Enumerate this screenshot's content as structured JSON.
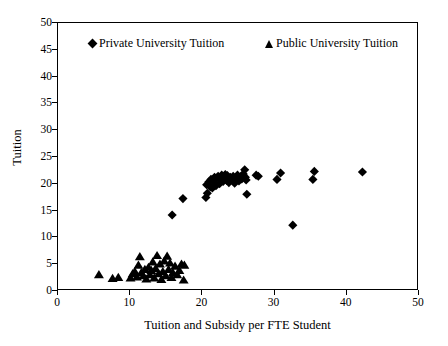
{
  "chart_data": {
    "type": "scatter",
    "title": "",
    "xlabel": "Tuition and Subsidy per FTE Student",
    "ylabel": "Tuition",
    "xlim": [
      0,
      50
    ],
    "ylim": [
      0,
      50
    ],
    "xticks": [
      0,
      10,
      20,
      30,
      40,
      50
    ],
    "yticks": [
      0,
      5,
      10,
      15,
      20,
      25,
      30,
      35,
      40,
      45,
      50
    ],
    "grid": false,
    "legend_position": "top-inside",
    "series": [
      {
        "name": "Private University Tuition",
        "marker": "diamond",
        "color": "#000000",
        "points": [
          [
            15.9,
            13.9
          ],
          [
            17.4,
            17.0
          ],
          [
            20.6,
            17.2
          ],
          [
            20.8,
            18.0
          ],
          [
            20.7,
            19.6
          ],
          [
            21.0,
            20.1
          ],
          [
            21.2,
            19.2
          ],
          [
            21.3,
            20.6
          ],
          [
            21.5,
            19.0
          ],
          [
            21.6,
            20.3
          ],
          [
            21.8,
            21.0
          ],
          [
            22.0,
            19.4
          ],
          [
            22.1,
            20.8
          ],
          [
            22.3,
            21.2
          ],
          [
            22.5,
            19.8
          ],
          [
            22.6,
            20.9
          ],
          [
            22.8,
            21.4
          ],
          [
            23.0,
            20.2
          ],
          [
            23.1,
            21.1
          ],
          [
            23.3,
            21.5
          ],
          [
            23.5,
            20.4
          ],
          [
            23.6,
            21.3
          ],
          [
            23.8,
            20.0
          ],
          [
            24.0,
            21.0
          ],
          [
            24.2,
            20.6
          ],
          [
            24.4,
            21.2
          ],
          [
            24.6,
            19.9
          ],
          [
            24.8,
            20.8
          ],
          [
            25.0,
            21.4
          ],
          [
            25.2,
            20.3
          ],
          [
            25.4,
            21.1
          ],
          [
            25.6,
            20.7
          ],
          [
            25.8,
            21.6
          ],
          [
            26.0,
            22.4
          ],
          [
            26.1,
            21.0
          ],
          [
            26.2,
            20.5
          ],
          [
            26.3,
            17.8
          ],
          [
            27.6,
            21.4
          ],
          [
            27.9,
            21.2
          ],
          [
            30.5,
            20.6
          ],
          [
            31.0,
            21.8
          ],
          [
            32.7,
            12.0
          ],
          [
            35.5,
            20.6
          ],
          [
            35.7,
            22.1
          ],
          [
            42.4,
            22.0
          ]
        ]
      },
      {
        "name": "Public University Tuition",
        "marker": "triangle",
        "color": "#000000",
        "points": [
          [
            5.7,
            2.6
          ],
          [
            7.6,
            1.9
          ],
          [
            8.4,
            2.1
          ],
          [
            10.1,
            2.0
          ],
          [
            10.4,
            2.8
          ],
          [
            10.7,
            3.2
          ],
          [
            11.0,
            2.2
          ],
          [
            11.2,
            4.4
          ],
          [
            11.4,
            6.0
          ],
          [
            11.6,
            3.0
          ],
          [
            11.9,
            2.4
          ],
          [
            12.1,
            3.6
          ],
          [
            12.3,
            1.8
          ],
          [
            12.6,
            4.0
          ],
          [
            12.8,
            2.6
          ],
          [
            13.0,
            3.4
          ],
          [
            13.2,
            5.0
          ],
          [
            13.4,
            2.0
          ],
          [
            13.6,
            3.8
          ],
          [
            13.8,
            6.2
          ],
          [
            14.0,
            2.8
          ],
          [
            14.2,
            4.6
          ],
          [
            14.4,
            1.7
          ],
          [
            14.6,
            3.2
          ],
          [
            14.8,
            5.2
          ],
          [
            15.0,
            2.4
          ],
          [
            15.2,
            6.1
          ],
          [
            15.4,
            3.6
          ],
          [
            15.6,
            4.8
          ],
          [
            15.8,
            2.1
          ],
          [
            16.0,
            3.0
          ],
          [
            16.3,
            4.2
          ],
          [
            16.6,
            2.6
          ],
          [
            16.9,
            3.4
          ],
          [
            17.2,
            4.6
          ],
          [
            17.5,
            1.6
          ],
          [
            17.6,
            4.4
          ]
        ]
      }
    ]
  },
  "axes": {
    "x_title": "Tuition and Subsidy per FTE Student",
    "y_title": "Tuition",
    "x_tick_labels": [
      "0",
      "10",
      "20",
      "30",
      "40",
      "50"
    ],
    "y_tick_labels": [
      "0",
      "5",
      "10",
      "15",
      "20",
      "25",
      "30",
      "35",
      "40",
      "45",
      "50"
    ]
  },
  "legend": {
    "entries": [
      {
        "label": "Private University Tuition",
        "marker": "diamond-marker"
      },
      {
        "label": "Public University Tuition",
        "marker": "triangle-marker"
      }
    ]
  }
}
